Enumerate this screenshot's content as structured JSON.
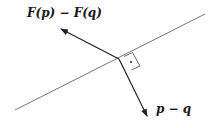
{
  "diagram": {
    "labels": {
      "normal_vector": "F(p) − F(q)",
      "difference_vector": "p − q"
    },
    "elements": {
      "line": {
        "from": [
          15,
          110
        ],
        "to": [
          205,
          14
        ]
      },
      "vertex": [
        119,
        59
      ],
      "arrow_normal": {
        "from": [
          119,
          59
        ],
        "to": [
          60,
          28
        ]
      },
      "arrow_difference": {
        "from": [
          119,
          59
        ],
        "to": [
          148,
          117
        ]
      },
      "right_angle_marker": {
        "corners": [
          [
            119,
            59
          ],
          [
            128,
            55
          ],
          [
            136,
            67
          ],
          [
            127,
            71
          ]
        ],
        "dot": [
          129,
          63
        ]
      }
    },
    "colors": {
      "line": "#555555",
      "arrow": "#222222",
      "background": "#ffffff"
    }
  }
}
